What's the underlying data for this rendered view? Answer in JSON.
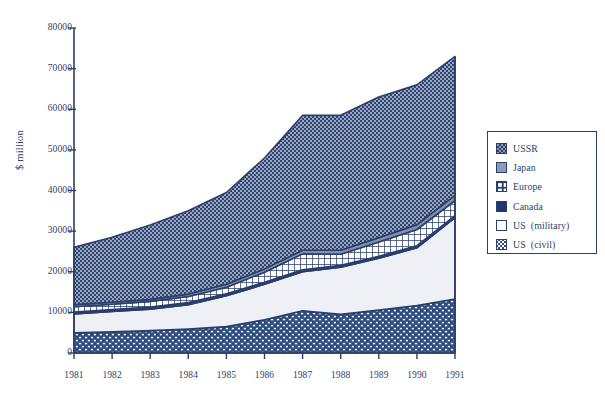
{
  "chart_data": {
    "type": "area",
    "stacked": true,
    "title": "",
    "subtitle": "",
    "xlabel": "",
    "ylabel": "$ million",
    "x": [
      1981,
      1982,
      1983,
      1984,
      1985,
      1986,
      1987,
      1988,
      1989,
      1990,
      1991
    ],
    "xtick_labels": [
      "1981",
      "1982",
      "1983",
      "1984",
      "1985",
      "1986",
      "1987",
      "1988",
      "1989",
      "1990",
      "1991"
    ],
    "ytick_labels": [
      "0",
      "10000",
      "20000",
      "30000",
      "40000",
      "50000",
      "60000",
      "70000",
      "80000"
    ],
    "ytick_values": [
      0,
      10000,
      20000,
      30000,
      40000,
      50000,
      60000,
      70000,
      80000
    ],
    "ylim": [
      0,
      80000
    ],
    "grid": false,
    "legend_position": "right",
    "stack_order_bottom_to_top": [
      "US  (civil)",
      "US  (military)",
      "Canada",
      "Europe",
      "Japan",
      "USSR"
    ],
    "series": [
      {
        "name": "US  (civil)",
        "color": "#2b4a7d",
        "pattern": "brick-dot",
        "values": [
          5000,
          5200,
          5500,
          5900,
          6500,
          8200,
          10400,
          9500,
          10600,
          11700,
          13300
        ]
      },
      {
        "name": "US  (military)",
        "color": "#eef0f4",
        "pattern": "solid-light",
        "values": [
          4600,
          5000,
          5300,
          6000,
          7600,
          8700,
          9600,
          11600,
          12700,
          14200,
          20000
        ]
      },
      {
        "name": "Canada",
        "color": "#23386a",
        "pattern": "solid-dark",
        "values": [
          500,
          500,
          500,
          500,
          500,
          500,
          500,
          500,
          500,
          500,
          500
        ]
      },
      {
        "name": "Europe",
        "color": "#ffffff",
        "pattern": "grid",
        "values": [
          1300,
          1300,
          1400,
          1500,
          1600,
          2500,
          3900,
          2700,
          3500,
          4000,
          3700
        ]
      },
      {
        "name": "Japan",
        "color": "#8c9ab5",
        "pattern": "fine-dot",
        "values": [
          500,
          500,
          500,
          600,
          700,
          800,
          900,
          1000,
          1100,
          1200,
          1300
        ]
      },
      {
        "name": "USSR",
        "color": "#8c9ab5",
        "pattern": "checker",
        "values": [
          14100,
          16000,
          18300,
          20500,
          22600,
          27300,
          33200,
          33200,
          34600,
          34400,
          34200
        ]
      }
    ],
    "totals": [
      26000,
      28500,
      31500,
      35000,
      39500,
      48000,
      58500,
      58500,
      63000,
      66000,
      73000
    ],
    "annotations": []
  },
  "legend": {
    "items": [
      {
        "label": "USSR",
        "swatch": "sw-ussr"
      },
      {
        "label": "Japan",
        "swatch": "sw-japan"
      },
      {
        "label": "Europe",
        "swatch": "sw-europe"
      },
      {
        "label": "Canada",
        "swatch": "sw-canada"
      },
      {
        "label": "US  (military)",
        "swatch": "sw-usmil"
      },
      {
        "label": "US  (civil)",
        "swatch": "sw-uscivil"
      }
    ]
  },
  "colors": {
    "stroke": "#2b3f6b",
    "ussr_fill": "#8c9ab5",
    "japan_fill": "#8c9ab5",
    "europe_fill": "#ffffff",
    "canada_fill": "#23386a",
    "us_military_fill": "#eef0f4",
    "us_civil_fill": "#2b4a7d",
    "background": "#ffffff",
    "text": "#2b3f6b"
  }
}
